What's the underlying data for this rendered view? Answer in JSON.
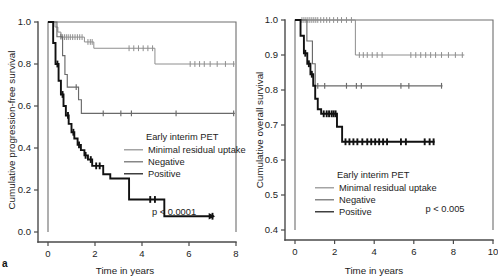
{
  "figure": {
    "panel_letter": "a",
    "background": "#ffffff"
  },
  "colors": {
    "minimal_residual_uptake": "#8e8e8e",
    "negative": "#6a6a6a",
    "positive": "#111111",
    "axis": "#4a4a4a"
  },
  "legend": {
    "title": "Early interim PET",
    "items": [
      {
        "label": "Minimal residual uptake",
        "key": "minimal_residual_uptake"
      },
      {
        "label": "Negative",
        "key": "negative"
      },
      {
        "label": "Positive",
        "key": "positive"
      }
    ]
  },
  "chart_data": [
    {
      "type": "line",
      "id": "progression-free-survival",
      "title": "",
      "xlabel": "Time in years",
      "ylabel": "Cumulative progression-free survival",
      "xlim": [
        0,
        8
      ],
      "ylim": [
        0.0,
        1.0
      ],
      "xticks": [
        0,
        2,
        4,
        6,
        8
      ],
      "xticklabels": [
        "0",
        "2",
        "4",
        "6",
        "8"
      ],
      "yticks": [
        0.0,
        0.2,
        0.4,
        0.6,
        0.8,
        1.0
      ],
      "yticklabels": [
        "0.0",
        "0.2",
        "0.4",
        "0.6",
        "0.8",
        "1.0"
      ],
      "grid": false,
      "legend_position": "center-right",
      "annotation": "p < 0.0001",
      "series": [
        {
          "name": "Minimal residual uptake",
          "key": "minimal_residual_uptake",
          "steps": [
            [
              0.0,
              1.0
            ],
            [
              0.3,
              1.0
            ],
            [
              0.3,
              0.976
            ],
            [
              0.42,
              0.976
            ],
            [
              0.42,
              0.952
            ],
            [
              0.55,
              0.952
            ],
            [
              0.55,
              0.928
            ],
            [
              1.55,
              0.928
            ],
            [
              1.55,
              0.905
            ],
            [
              1.95,
              0.905
            ],
            [
              1.95,
              0.875
            ],
            [
              4.55,
              0.875
            ],
            [
              4.55,
              0.8
            ],
            [
              7.95,
              0.8
            ]
          ],
          "censor_times": [
            0.62,
            0.7,
            0.78,
            0.86,
            0.95,
            1.05,
            1.15,
            1.25,
            1.35,
            1.45,
            1.7,
            1.8,
            1.88,
            3.45,
            3.65,
            3.85,
            4.05,
            4.25,
            4.45,
            6.05,
            6.25,
            6.45,
            6.65,
            6.9,
            7.2,
            7.55,
            7.9
          ]
        },
        {
          "name": "Negative",
          "key": "negative",
          "steps": [
            [
              0.0,
              1.0
            ],
            [
              0.38,
              1.0
            ],
            [
              0.38,
              0.93
            ],
            [
              0.62,
              0.93
            ],
            [
              0.62,
              0.84
            ],
            [
              0.72,
              0.84
            ],
            [
              0.72,
              0.75
            ],
            [
              0.82,
              0.75
            ],
            [
              0.82,
              0.69
            ],
            [
              1.3,
              0.69
            ],
            [
              1.3,
              0.63
            ],
            [
              1.42,
              0.63
            ],
            [
              1.42,
              0.565
            ],
            [
              7.95,
              0.565
            ]
          ],
          "censor_times": [
            0.55,
            1.2,
            2.35,
            3.1,
            3.55,
            5.45,
            7.9
          ]
        },
        {
          "name": "Positive",
          "key": "positive",
          "steps": [
            [
              0.0,
              1.0
            ],
            [
              0.22,
              1.0
            ],
            [
              0.22,
              0.9
            ],
            [
              0.32,
              0.9
            ],
            [
              0.32,
              0.8
            ],
            [
              0.45,
              0.8
            ],
            [
              0.45,
              0.72
            ],
            [
              0.55,
              0.72
            ],
            [
              0.55,
              0.655
            ],
            [
              0.66,
              0.655
            ],
            [
              0.66,
              0.6
            ],
            [
              0.76,
              0.6
            ],
            [
              0.76,
              0.555
            ],
            [
              0.88,
              0.555
            ],
            [
              0.88,
              0.515
            ],
            [
              1.0,
              0.515
            ],
            [
              1.0,
              0.475
            ],
            [
              1.12,
              0.475
            ],
            [
              1.12,
              0.445
            ],
            [
              1.26,
              0.445
            ],
            [
              1.26,
              0.415
            ],
            [
              1.4,
              0.415
            ],
            [
              1.4,
              0.39
            ],
            [
              1.55,
              0.39
            ],
            [
              1.55,
              0.365
            ],
            [
              1.7,
              0.365
            ],
            [
              1.7,
              0.345
            ],
            [
              1.88,
              0.345
            ],
            [
              1.88,
              0.315
            ],
            [
              2.35,
              0.315
            ],
            [
              2.35,
              0.275
            ],
            [
              2.65,
              0.275
            ],
            [
              2.65,
              0.255
            ],
            [
              3.45,
              0.255
            ],
            [
              3.45,
              0.155
            ],
            [
              4.95,
              0.155
            ],
            [
              4.95,
              0.075
            ],
            [
              7.05,
              0.075
            ]
          ],
          "censor_times": [
            0.4,
            0.62,
            0.85,
            1.08,
            1.32,
            1.6,
            1.82,
            2.05,
            2.2,
            4.35,
            4.55,
            7.0
          ]
        }
      ]
    },
    {
      "type": "line",
      "id": "overall-survival",
      "title": "",
      "xlabel": "Time in years",
      "ylabel": "Cumulative overall survival",
      "xlim": [
        0,
        10
      ],
      "ylim": [
        0.4,
        1.0
      ],
      "xticks": [
        0,
        2,
        4,
        6,
        8,
        10
      ],
      "xticklabels": [
        "0",
        "2",
        "4",
        "6",
        "8",
        "10"
      ],
      "yticks": [
        0.4,
        0.5,
        0.6,
        0.7,
        0.8,
        0.9,
        1.0
      ],
      "yticklabels": [
        "0.4",
        "0.5",
        "0.6",
        "0.7",
        "0.8",
        "0.9",
        "1.0"
      ],
      "grid": false,
      "legend_position": "lower-left",
      "annotation": "p < 0.005",
      "series": [
        {
          "name": "Minimal residual uptake",
          "key": "minimal_residual_uptake",
          "steps": [
            [
              0.0,
              1.0
            ],
            [
              3.05,
              1.0
            ],
            [
              3.05,
              0.9
            ],
            [
              8.55,
              0.9
            ]
          ],
          "censor_times": [
            0.35,
            0.45,
            0.55,
            0.65,
            0.75,
            0.85,
            0.95,
            1.05,
            1.15,
            1.3,
            1.45,
            1.6,
            1.75,
            1.95,
            2.15,
            2.35,
            2.6,
            2.85,
            3.25,
            3.45,
            3.65,
            3.9,
            4.15,
            4.4,
            5.85,
            6.1,
            6.35,
            6.6,
            6.85,
            7.1,
            7.4,
            7.75,
            8.1,
            8.45
          ]
        },
        {
          "name": "Negative",
          "key": "negative",
          "steps": [
            [
              0.0,
              1.0
            ],
            [
              0.6,
              1.0
            ],
            [
              0.6,
              0.94
            ],
            [
              0.88,
              0.94
            ],
            [
              0.88,
              0.875
            ],
            [
              1.02,
              0.875
            ],
            [
              1.02,
              0.812
            ],
            [
              7.45,
              0.812
            ]
          ],
          "censor_times": [
            1.15,
            1.5,
            2.6,
            3.1,
            3.35,
            5.35,
            5.75,
            7.4
          ]
        },
        {
          "name": "Positive",
          "key": "positive",
          "steps": [
            [
              0.0,
              1.0
            ],
            [
              0.28,
              1.0
            ],
            [
              0.28,
              0.955
            ],
            [
              0.45,
              0.955
            ],
            [
              0.45,
              0.905
            ],
            [
              0.62,
              0.905
            ],
            [
              0.62,
              0.875
            ],
            [
              0.78,
              0.875
            ],
            [
              0.78,
              0.845
            ],
            [
              0.92,
              0.845
            ],
            [
              0.92,
              0.812
            ],
            [
              1.02,
              0.812
            ],
            [
              1.02,
              0.775
            ],
            [
              1.15,
              0.775
            ],
            [
              1.15,
              0.745
            ],
            [
              1.32,
              0.745
            ],
            [
              1.32,
              0.732
            ],
            [
              2.12,
              0.732
            ],
            [
              2.12,
              0.695
            ],
            [
              2.38,
              0.695
            ],
            [
              2.38,
              0.652
            ],
            [
              7.05,
              0.652
            ]
          ],
          "censor_times": [
            0.52,
            0.7,
            0.85,
            1.45,
            1.6,
            1.72,
            1.85,
            1.95,
            2.05,
            2.55,
            2.75,
            2.95,
            3.15,
            3.4,
            3.65,
            3.85,
            4.05,
            4.25,
            4.45,
            4.65,
            5.35,
            5.6,
            6.55,
            6.8,
            7.0
          ]
        }
      ]
    }
  ]
}
